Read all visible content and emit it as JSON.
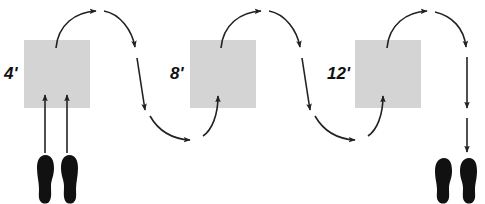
{
  "diagram": {
    "colors": {
      "box_fill": "#d4d4d4",
      "stroke": "#222222",
      "foot": "#111111",
      "label": "#111111"
    },
    "boxes": [
      {
        "id": "box-1",
        "label": "4'",
        "x": 24,
        "y": 40,
        "w": 66,
        "h": 68
      },
      {
        "id": "box-2",
        "label": "8'",
        "x": 190,
        "y": 40,
        "w": 66,
        "h": 68
      },
      {
        "id": "box-3",
        "label": "12'",
        "x": 355,
        "y": 40,
        "w": 66,
        "h": 68
      }
    ],
    "start_feet": {
      "label": "start-footprints"
    },
    "end_feet": {
      "label": "end-footprints"
    }
  }
}
